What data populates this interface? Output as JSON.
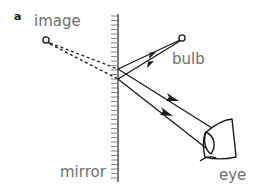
{
  "figure": {
    "panel_label": "a",
    "title": "",
    "labels": {
      "image": "image",
      "bulb": "bulb",
      "mirror": "mirror",
      "eye": "eye"
    },
    "colors": {
      "stroke": "#1a1a1a",
      "mirror_line": "#5a5a5a",
      "mirror_hatch": "#8c8c8c",
      "label_text": "#6e6e6e",
      "panel_text": "#1a1a1a",
      "background": "#ffffff"
    },
    "geometry": {
      "mirror_x": 118,
      "mirror_top_y": 14,
      "mirror_bottom_y": 182,
      "image_point": [
        46,
        40
      ],
      "bulb_point": [
        182,
        38
      ],
      "reflection_point_upper": [
        118,
        69
      ],
      "reflection_point_lower": [
        118,
        79
      ],
      "eye_center": [
        218,
        140
      ]
    },
    "elements": {
      "virtual_rays_style": "dashed",
      "real_rays_style": "solid",
      "arrow_direction_incident": "toward-mirror",
      "arrow_direction_reflected": "toward-eye"
    }
  }
}
